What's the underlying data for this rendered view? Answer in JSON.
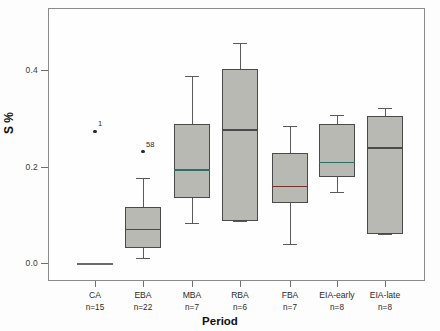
{
  "chart_data": {
    "type": "box",
    "title": "",
    "xlabel": "Period",
    "ylabel": "S %",
    "ylim": [
      -0.03,
      0.48
    ],
    "yticks": [
      0.0,
      0.2,
      0.4
    ],
    "ytick_labels": [
      "0.0",
      "0.2",
      "0.4"
    ],
    "grid": false,
    "legend": "none",
    "categories": [
      "CA",
      "EBA",
      "MBA",
      "RBA",
      "FBA",
      "EIA-early",
      "EIA-late"
    ],
    "counts": [
      "n=15",
      "n=22",
      "n=7",
      "n=6",
      "n=7",
      "n=8",
      "n=8"
    ],
    "boxes": [
      {
        "category": "CA",
        "n": 15,
        "min": 0.0,
        "q1": 0.0,
        "median": 0.0,
        "q3": 0.0,
        "max": 0.0,
        "degenerate": true,
        "median_color": "#6a6a6a"
      },
      {
        "category": "EBA",
        "n": 22,
        "min": 0.01,
        "q1": 0.032,
        "median": 0.071,
        "q3": 0.116,
        "max": 0.176,
        "degenerate": false,
        "median_color": "#4a4a4a"
      },
      {
        "category": "MBA",
        "n": 7,
        "min": 0.083,
        "q1": 0.135,
        "median": 0.194,
        "q3": 0.289,
        "max": 0.387,
        "degenerate": false,
        "median_color": "#2f6f62"
      },
      {
        "category": "RBA",
        "n": 6,
        "min": 0.087,
        "q1": 0.087,
        "median": 0.277,
        "q3": 0.402,
        "max": 0.455,
        "degenerate": false,
        "median_color": "#4a4a4a"
      },
      {
        "category": "FBA",
        "n": 7,
        "min": 0.04,
        "q1": 0.124,
        "median": 0.16,
        "q3": 0.228,
        "max": 0.283,
        "degenerate": false,
        "median_color": "#7b3030"
      },
      {
        "category": "EIA-early",
        "n": 8,
        "min": 0.148,
        "q1": 0.178,
        "median": 0.21,
        "q3": 0.288,
        "max": 0.306,
        "degenerate": false,
        "median_color": "#2f6f62"
      },
      {
        "category": "EIA-late",
        "n": 8,
        "min": 0.061,
        "q1": 0.061,
        "median": 0.24,
        "q3": 0.305,
        "max": 0.322,
        "degenerate": false,
        "median_color": "#4a4a4a"
      }
    ],
    "outliers": [
      {
        "category": "CA",
        "value": 0.273,
        "label": "1"
      },
      {
        "category": "EBA",
        "value": 0.231,
        "label": "58"
      }
    ]
  },
  "axes": {
    "y_title": "S %",
    "x_title": "Period"
  }
}
